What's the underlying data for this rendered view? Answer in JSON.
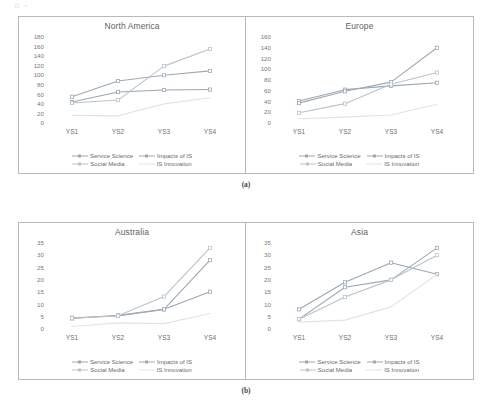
{
  "figure": {
    "artifact_label": "⊙ ⌁",
    "caption_a": "(a)",
    "caption_b": "(b)"
  },
  "series_meta": [
    {
      "key": "service_science",
      "label": "Service Science",
      "color": "#9aa7b4",
      "marker": true
    },
    {
      "key": "impacts_of_is",
      "label": "Impacts of IS",
      "color": "#9fa9b3",
      "marker": true
    },
    {
      "key": "social_media",
      "label": "Social Media",
      "color": "#b9c3cb",
      "marker": true
    },
    {
      "key": "is_innovation",
      "label": "IS Innovation",
      "color": "#dfe4e8",
      "marker": false
    }
  ],
  "legend": {
    "service_science": "Service Science",
    "impacts_of_is": "Impacts of IS",
    "social_media": "Social Media",
    "is_innovation": "IS Innovation"
  },
  "chart_data": [
    {
      "type": "line",
      "title": "North America",
      "xlabel": "",
      "ylabel": "",
      "categories": [
        "YS1",
        "YS2",
        "YS3",
        "YS4"
      ],
      "ylim": [
        0,
        180
      ],
      "yticks": [
        0,
        20,
        40,
        60,
        80,
        100,
        120,
        140,
        160,
        180
      ],
      "grid": false,
      "legend_position": "bottom",
      "series": [
        {
          "name": "Service Science",
          "values": [
            44,
            65,
            69,
            70
          ]
        },
        {
          "name": "Impacts of IS",
          "values": [
            55,
            88,
            100,
            109
          ]
        },
        {
          "name": "Social Media",
          "values": [
            42,
            48,
            119,
            155
          ]
        },
        {
          "name": "IS Innovation",
          "values": [
            16,
            15,
            40,
            53
          ]
        }
      ]
    },
    {
      "type": "line",
      "title": "Europe",
      "xlabel": "",
      "ylabel": "",
      "categories": [
        "YS1",
        "YS2",
        "YS3",
        "YS4"
      ],
      "ylim": [
        0,
        160
      ],
      "yticks": [
        0,
        20,
        40,
        60,
        80,
        100,
        120,
        140,
        160
      ],
      "grid": false,
      "legend_position": "bottom",
      "series": [
        {
          "name": "Service Science",
          "values": [
            41,
            62,
            69,
            75
          ]
        },
        {
          "name": "Impacts of IS",
          "values": [
            37,
            59,
            76,
            140
          ]
        },
        {
          "name": "Social Media",
          "values": [
            19,
            36,
            72,
            94
          ]
        },
        {
          "name": "IS Innovation",
          "values": [
            8,
            11,
            15,
            35
          ]
        }
      ]
    },
    {
      "type": "line",
      "title": "Australia",
      "xlabel": "",
      "ylabel": "",
      "categories": [
        "YS1",
        "YS2",
        "YS3",
        "YS4"
      ],
      "ylim": [
        0,
        35
      ],
      "yticks": [
        0,
        5,
        10,
        15,
        20,
        25,
        30,
        35
      ],
      "grid": false,
      "legend_position": "bottom",
      "series": [
        {
          "name": "Service Science",
          "values": [
            4.6,
            5.3,
            8,
            15.2
          ]
        },
        {
          "name": "Impacts of IS",
          "values": [
            4.3,
            5.6,
            8,
            28
          ]
        },
        {
          "name": "Social Media",
          "values": [
            4.4,
            5.4,
            13.2,
            33
          ]
        },
        {
          "name": "IS Innovation",
          "values": [
            1,
            2.5,
            2.2,
            6.3
          ]
        }
      ]
    },
    {
      "type": "line",
      "title": "Asia",
      "xlabel": "",
      "ylabel": "",
      "categories": [
        "YS1",
        "YS2",
        "YS3",
        "YS4"
      ],
      "ylim": [
        0,
        35
      ],
      "yticks": [
        0,
        5,
        10,
        15,
        20,
        25,
        30,
        35
      ],
      "grid": false,
      "legend_position": "bottom",
      "series": [
        {
          "name": "Service Science",
          "values": [
            8,
            19,
            27,
            22.3
          ]
        },
        {
          "name": "Impacts of IS",
          "values": [
            4,
            17,
            20,
            33
          ]
        },
        {
          "name": "Social Media",
          "values": [
            4,
            13,
            20,
            30
          ]
        },
        {
          "name": "IS Innovation",
          "values": [
            2.8,
            3.6,
            9,
            22.2
          ]
        }
      ]
    }
  ]
}
